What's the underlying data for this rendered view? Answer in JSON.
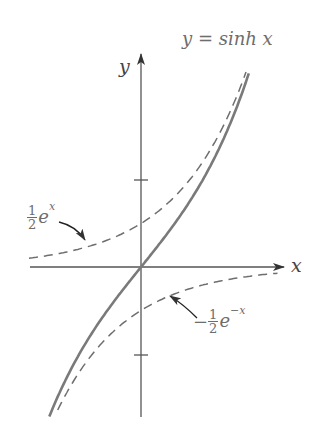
{
  "figure": {
    "title_label": "y = sinh x",
    "axis_labels": {
      "x": "x",
      "y": "y"
    },
    "annotations": {
      "half_exp": {
        "coef_num": "1",
        "coef_den": "2",
        "base": "e",
        "exponent": "x"
      },
      "neg_half_exp_neg": {
        "sign": "−",
        "coef_num": "1",
        "coef_den": "2",
        "base": "e",
        "exponent": "−x"
      }
    },
    "ticks": {
      "y": [
        1,
        -1
      ]
    },
    "colors": {
      "axis": "#555555",
      "curve": "#7a7a7a",
      "dashed": "#6e6e6e",
      "text": "#6d6d6d"
    }
  },
  "chart_data": {
    "type": "line",
    "title": "y = sinh x",
    "xlabel": "x",
    "ylabel": "y",
    "xlim": [
      -1.6,
      2.0
    ],
    "ylim": [
      -1.72,
      2.45
    ],
    "grid": false,
    "legend": "none (inline annotations)",
    "y_ticks": [
      -1,
      1
    ],
    "series": [
      {
        "name": "y = sinh x",
        "style": "solid",
        "function": "sinh(x)",
        "x": [
          -1.3,
          -1.0,
          -0.5,
          0,
          0.5,
          1.0,
          1.5,
          1.6
        ],
        "y": [
          -1.7,
          -1.18,
          -0.52,
          0,
          0.52,
          1.18,
          2.13,
          2.38
        ]
      },
      {
        "name": "1/2 e^x",
        "style": "dashed",
        "function": "0.5*exp(x)",
        "x": [
          -1.6,
          -1.0,
          -0.5,
          0,
          0.5,
          1.0,
          1.5
        ],
        "y": [
          0.1,
          0.18,
          0.3,
          0.5,
          0.82,
          1.36,
          2.24
        ]
      },
      {
        "name": "-1/2 e^-x",
        "style": "dashed",
        "function": "-0.5*exp(-x)",
        "x": [
          -1.2,
          -1.0,
          -0.5,
          0,
          0.5,
          1.0,
          1.5,
          2.0
        ],
        "y": [
          -1.66,
          -1.36,
          -0.82,
          -0.5,
          -0.3,
          -0.18,
          -0.11,
          -0.07
        ]
      }
    ]
  }
}
